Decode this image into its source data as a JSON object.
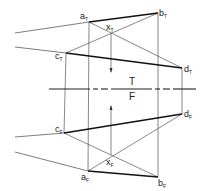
{
  "diagram": {
    "type": "orthographic-projection",
    "reference_line": {
      "upper_label": "T",
      "lower_label": "F"
    },
    "points_top": {
      "a": {
        "label": "a",
        "sub": "T",
        "x": 89,
        "y": 22
      },
      "b": {
        "label": "b",
        "sub": "T",
        "x": 158,
        "y": 13
      },
      "c": {
        "label": "c",
        "sub": "T",
        "x": 66,
        "y": 53
      },
      "d": {
        "label": "d",
        "sub": "T",
        "x": 182,
        "y": 68
      },
      "x": {
        "label": "x",
        "sub": "T",
        "x": 111,
        "y": 33
      }
    },
    "points_front": {
      "a": {
        "label": "a",
        "sub": "F",
        "x": 88,
        "y": 171
      },
      "b": {
        "label": "b",
        "sub": "F",
        "x": 158,
        "y": 177
      },
      "c": {
        "label": "c",
        "sub": "F",
        "x": 64,
        "y": 133
      },
      "d": {
        "label": "d",
        "sub": "F",
        "x": 182,
        "y": 114
      },
      "x": {
        "label": "x",
        "sub": "F",
        "x": 111,
        "y": 155
      }
    },
    "lines": [
      {
        "from": "a_T",
        "to": "b_T",
        "weight": "heavy"
      },
      {
        "from": "c_T",
        "to": "d_T",
        "weight": "heavy"
      },
      {
        "from": "c_F",
        "to": "d_F",
        "weight": "heavy"
      },
      {
        "from": "a_F",
        "to": "b_F",
        "weight": "heavy"
      },
      {
        "from": "a_T",
        "to": "d_T",
        "weight": "thin"
      },
      {
        "from": "c_T",
        "to": "b_T",
        "weight": "thin"
      },
      {
        "from": "c_F",
        "to": "b_F",
        "weight": "thin"
      },
      {
        "from": "a_F",
        "to": "d_F",
        "weight": "thin"
      }
    ]
  }
}
